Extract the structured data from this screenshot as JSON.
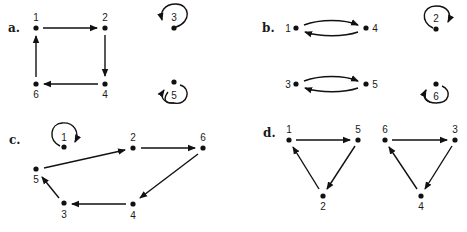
{
  "panels": [
    {
      "label": "a.",
      "nodes": [
        {
          "id": "1",
          "x": 36,
          "y": 28,
          "lx": 36,
          "ly": 21
        },
        {
          "id": "2",
          "x": 105,
          "y": 28,
          "lx": 105,
          "ly": 21
        },
        {
          "id": "4",
          "x": 105,
          "y": 84,
          "lx": 105,
          "ly": 98
        },
        {
          "id": "6",
          "x": 36,
          "y": 84,
          "lx": 36,
          "ly": 98
        },
        {
          "id": "3",
          "x": 174,
          "y": 28,
          "lx": 174,
          "ly": 21
        },
        {
          "id": "5",
          "x": 174,
          "y": 82,
          "lx": 174,
          "ly": 98
        }
      ],
      "edges": [
        [
          "1",
          "2"
        ],
        [
          "2",
          "4"
        ],
        [
          "4",
          "6"
        ],
        [
          "6",
          "1"
        ],
        [
          "3",
          "3"
        ],
        [
          "5",
          "5"
        ]
      ]
    },
    {
      "label": "b.",
      "nodes": [
        {
          "id": "1",
          "x": 296,
          "y": 28,
          "lx": 288,
          "ly": 32
        },
        {
          "id": "4",
          "x": 366,
          "y": 28,
          "lx": 375,
          "ly": 32
        },
        {
          "id": "3",
          "x": 296,
          "y": 84,
          "lx": 288,
          "ly": 88
        },
        {
          "id": "5",
          "x": 366,
          "y": 84,
          "lx": 375,
          "ly": 88
        },
        {
          "id": "2",
          "x": 436,
          "y": 29,
          "lx": 436,
          "ly": 22
        },
        {
          "id": "6",
          "x": 436,
          "y": 84,
          "lx": 436,
          "ly": 98
        }
      ],
      "edges": [
        [
          "1",
          "4"
        ],
        [
          "4",
          "1"
        ],
        [
          "3",
          "5"
        ],
        [
          "5",
          "3"
        ],
        [
          "2",
          "2"
        ],
        [
          "6",
          "6"
        ]
      ]
    },
    {
      "label": "c.",
      "nodes": [
        {
          "id": "1",
          "x": 64,
          "y": 147,
          "lx": 64,
          "ly": 140
        },
        {
          "id": "2",
          "x": 133,
          "y": 148,
          "lx": 133,
          "ly": 140
        },
        {
          "id": "6",
          "x": 203,
          "y": 148,
          "lx": 203,
          "ly": 140
        },
        {
          "id": "5",
          "x": 36,
          "y": 169,
          "lx": 36,
          "ly": 183
        },
        {
          "id": "3",
          "x": 64,
          "y": 203,
          "lx": 64,
          "ly": 217
        },
        {
          "id": "4",
          "x": 133,
          "y": 204,
          "lx": 133,
          "ly": 218
        }
      ],
      "edges": [
        [
          "1",
          "1"
        ],
        [
          "5",
          "2"
        ],
        [
          "2",
          "6"
        ],
        [
          "6",
          "4"
        ],
        [
          "4",
          "3"
        ],
        [
          "3",
          "5"
        ]
      ]
    },
    {
      "label": "d.",
      "nodes": [
        {
          "id": "1",
          "x": 289,
          "y": 140,
          "lx": 289,
          "ly": 133
        },
        {
          "id": "5",
          "x": 358,
          "y": 140,
          "lx": 358,
          "ly": 133
        },
        {
          "id": "2",
          "x": 323,
          "y": 196,
          "lx": 323,
          "ly": 210
        },
        {
          "id": "6",
          "x": 385,
          "y": 140,
          "lx": 385,
          "ly": 133
        },
        {
          "id": "3",
          "x": 455,
          "y": 140,
          "lx": 455,
          "ly": 133
        },
        {
          "id": "4",
          "x": 421,
          "y": 196,
          "lx": 421,
          "ly": 210
        }
      ],
      "edges": [
        [
          "1",
          "5"
        ],
        [
          "5",
          "2"
        ],
        [
          "2",
          "1"
        ],
        [
          "6",
          "3"
        ],
        [
          "3",
          "4"
        ],
        [
          "4",
          "6"
        ]
      ]
    }
  ]
}
